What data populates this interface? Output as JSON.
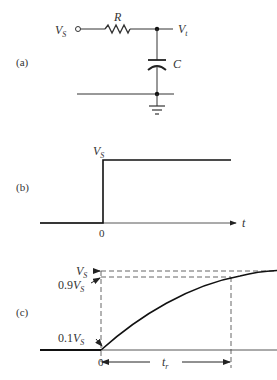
{
  "panel_a": {
    "label": "(a)",
    "input_label": "V",
    "input_sub": "S",
    "resistor_label": "R",
    "output_label": "V",
    "output_sub": "t",
    "capacitor_label": "C"
  },
  "panel_b": {
    "label": "(b)",
    "level_label": "V",
    "level_sub": "S",
    "zero_label": "0",
    "axis_label": "t"
  },
  "panel_c": {
    "label": "(c)",
    "vs_label": "V",
    "vs_sub": "S",
    "v90_prefix": "0.9",
    "v90_label": "V",
    "v90_sub": "S",
    "v10_prefix": "0.1",
    "v10_label": "V",
    "v10_sub": "S",
    "zero_label": "0",
    "rise_label": "t",
    "rise_sub": "r"
  },
  "colors": {
    "line": "#222222",
    "dash": "#555555",
    "text": "#333333"
  }
}
